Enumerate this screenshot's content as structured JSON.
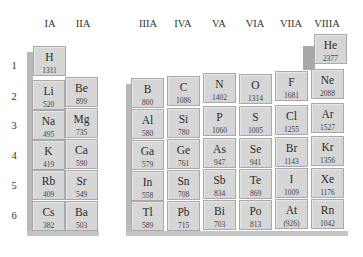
{
  "groups": [
    {
      "label": "IA",
      "x": 33
    },
    {
      "label": "IIA",
      "x": 66
    },
    {
      "label": "IIIA",
      "x": 131
    },
    {
      "label": "IVA",
      "x": 166
    },
    {
      "label": "VA",
      "x": 202
    },
    {
      "label": "VIA",
      "x": 238
    },
    {
      "label": "VIIA",
      "x": 274
    },
    {
      "label": "VIIIA",
      "x": 310
    }
  ],
  "periods": [
    {
      "label": "1",
      "y": 60
    },
    {
      "label": "2",
      "y": 91
    },
    {
      "label": "3",
      "y": 120
    },
    {
      "label": "4",
      "y": 150
    },
    {
      "label": "5",
      "y": 180
    },
    {
      "label": "6",
      "y": 210
    }
  ],
  "elements": [
    {
      "symbol": "H",
      "ie": "1311",
      "x": 33,
      "y": 46
    },
    {
      "symbol": "Li",
      "ie": "520",
      "x": 32,
      "y": 80
    },
    {
      "symbol": "Be",
      "ie": "899",
      "x": 65,
      "y": 77
    },
    {
      "symbol": "Na",
      "ie": "495",
      "x": 32,
      "y": 110
    },
    {
      "symbol": "Mg",
      "ie": "735",
      "x": 65,
      "y": 108
    },
    {
      "symbol": "K",
      "ie": "419",
      "x": 32,
      "y": 140
    },
    {
      "symbol": "Ca",
      "ie": "590",
      "x": 65,
      "y": 139
    },
    {
      "symbol": "Rb",
      "ie": "409",
      "x": 32,
      "y": 170
    },
    {
      "symbol": "Sr",
      "ie": "549",
      "x": 65,
      "y": 170
    },
    {
      "symbol": "Cs",
      "ie": "382",
      "x": 32,
      "y": 201
    },
    {
      "symbol": "Ba",
      "ie": "503",
      "x": 65,
      "y": 201
    },
    {
      "symbol": "B",
      "ie": "800",
      "x": 131,
      "y": 78
    },
    {
      "symbol": "C",
      "ie": "1086",
      "x": 167,
      "y": 76
    },
    {
      "symbol": "N",
      "ie": "1402",
      "x": 203,
      "y": 73
    },
    {
      "symbol": "O",
      "ie": "1314",
      "x": 239,
      "y": 74
    },
    {
      "symbol": "F",
      "ie": "1681",
      "x": 275,
      "y": 71
    },
    {
      "symbol": "Ne",
      "ie": "2088",
      "x": 311,
      "y": 69
    },
    {
      "symbol": "He",
      "ie": "2377",
      "x": 314,
      "y": 34
    },
    {
      "symbol": "Al",
      "ie": "580",
      "x": 131,
      "y": 109
    },
    {
      "symbol": "Si",
      "ie": "780",
      "x": 167,
      "y": 108
    },
    {
      "symbol": "P",
      "ie": "1060",
      "x": 203,
      "y": 106
    },
    {
      "symbol": "S",
      "ie": "1005",
      "x": 239,
      "y": 106
    },
    {
      "symbol": "Cl",
      "ie": "1255",
      "x": 275,
      "y": 105
    },
    {
      "symbol": "Ar",
      "ie": "1527",
      "x": 311,
      "y": 103
    },
    {
      "symbol": "Ga",
      "ie": "579",
      "x": 131,
      "y": 140
    },
    {
      "symbol": "Ge",
      "ie": "761",
      "x": 167,
      "y": 139
    },
    {
      "symbol": "As",
      "ie": "947",
      "x": 203,
      "y": 138
    },
    {
      "symbol": "Se",
      "ie": "941",
      "x": 239,
      "y": 138
    },
    {
      "symbol": "Br",
      "ie": "1143",
      "x": 275,
      "y": 137
    },
    {
      "symbol": "Kr",
      "ie": "1356",
      "x": 311,
      "y": 136
    },
    {
      "symbol": "In",
      "ie": "558",
      "x": 131,
      "y": 171
    },
    {
      "symbol": "Sn",
      "ie": "708",
      "x": 167,
      "y": 170
    },
    {
      "symbol": "Sb",
      "ie": "834",
      "x": 203,
      "y": 169
    },
    {
      "symbol": "Te",
      "ie": "869",
      "x": 239,
      "y": 169
    },
    {
      "symbol": "I",
      "ie": "1009",
      "x": 275,
      "y": 168
    },
    {
      "symbol": "Xe",
      "ie": "1176",
      "x": 311,
      "y": 168
    },
    {
      "symbol": "Tl",
      "ie": "589",
      "x": 131,
      "y": 201
    },
    {
      "symbol": "Pb",
      "ie": "715",
      "x": 167,
      "y": 201
    },
    {
      "symbol": "Bi",
      "ie": "703",
      "x": 203,
      "y": 200
    },
    {
      "symbol": "Po",
      "ie": "813",
      "x": 239,
      "y": 200
    },
    {
      "symbol": "At",
      "ie": "(926)",
      "x": 275,
      "y": 199
    },
    {
      "symbol": "Rn",
      "ie": "1042",
      "x": 311,
      "y": 199
    }
  ]
}
